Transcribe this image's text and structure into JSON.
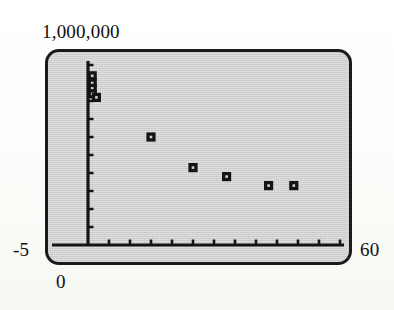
{
  "figure": {
    "kind": "graphing-calculator-scatter-plot",
    "screen_background": "#d2d2d2",
    "ink_color": "#141414"
  },
  "window_labels": {
    "y_max": "1,000,000",
    "y_min": "-5",
    "x_min": "0",
    "x_max": "60"
  },
  "chart_data": {
    "type": "scatter",
    "title": "",
    "xlabel": "",
    "ylabel": "",
    "xlim": [
      0,
      60
    ],
    "ylim": [
      -5,
      1000000
    ],
    "grid": false,
    "legend": false,
    "axis_style": "calculator-window-with-tick-marks",
    "x_tick_interval": 5,
    "y_tick_interval": 100000,
    "marker": "square-with-light-center",
    "series": [
      {
        "name": "data",
        "x": [
          1,
          1,
          1,
          1,
          2,
          15,
          25,
          33,
          43,
          49
        ],
        "y": [
          940000,
          900000,
          870000,
          840000,
          820000,
          600000,
          430000,
          380000,
          330000,
          330000
        ]
      }
    ]
  }
}
